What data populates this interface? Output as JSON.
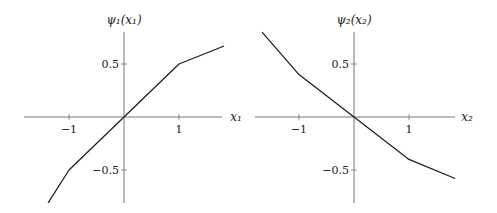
{
  "chart_data": [
    {
      "type": "line",
      "title": "",
      "xlabel": "x_1",
      "ylabel": "ψ_1(x_1)",
      "xlabel_display": "x₁",
      "ylabel_display": "ψ₁(x₁)",
      "x": [
        -1.38,
        -1,
        1,
        1.82
      ],
      "series": [
        {
          "name": "psi_1",
          "values": [
            -0.81,
            -0.5,
            0.5,
            0.67
          ]
        }
      ],
      "xticks": [
        -1,
        1
      ],
      "yticks": [
        0.5,
        -0.5
      ],
      "xtick_labels": [
        "−1",
        "1"
      ],
      "ytick_labels": [
        "0.5",
        "−0.5"
      ],
      "xlim": [
        -1.82,
        1.78
      ],
      "ylim": [
        -0.81,
        0.8
      ],
      "grid": false,
      "legend": null
    },
    {
      "type": "line",
      "title": "",
      "xlabel": "x_2",
      "ylabel": "ψ_2(x_2)",
      "xlabel_display": "x₂",
      "ylabel_display": "ψ₂(x₂)",
      "x": [
        -1.67,
        -1,
        1,
        1.84
      ],
      "series": [
        {
          "name": "psi_2",
          "values": [
            0.8,
            0.4,
            -0.4,
            -0.58
          ]
        }
      ],
      "xticks": [
        -1,
        1
      ],
      "yticks": [
        0.5,
        -0.5
      ],
      "xtick_labels": [
        "−1",
        "1"
      ],
      "ytick_labels": [
        "0.5",
        "−0.5"
      ],
      "xlim": [
        -1.8,
        1.84
      ],
      "ylim": [
        -0.81,
        0.8
      ],
      "grid": false,
      "legend": null
    }
  ],
  "style": {
    "line_color": "#1a1a1a",
    "axis_color": "#555555"
  }
}
